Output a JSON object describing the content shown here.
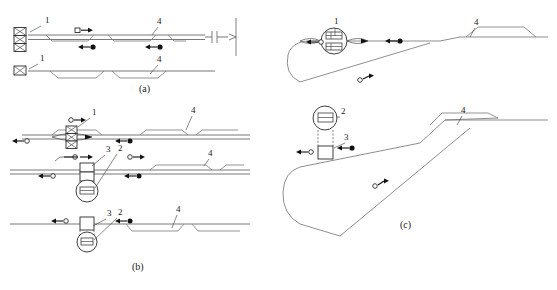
{
  "figure": {
    "title": "",
    "background": "#ffffff",
    "line_color": "#6a6a6a",
    "marker_solid_color": "#111111",
    "marker_open_color": "#ffffff",
    "width": 557,
    "height": 290
  },
  "panels": [
    {
      "id": "a",
      "caption": "(a)",
      "caption_x": 139,
      "caption_y": 92,
      "callouts": [
        {
          "text": "1",
          "x": 45,
          "y": 23
        },
        {
          "text": "4",
          "x": 157,
          "y": 24
        },
        {
          "text": "1",
          "x": 40,
          "y": 61
        },
        {
          "text": "4",
          "x": 157,
          "y": 62
        }
      ]
    },
    {
      "id": "b",
      "caption": "(b)",
      "caption_x": 132,
      "caption_y": 270,
      "callouts": [
        {
          "text": "1",
          "x": 92,
          "y": 115
        },
        {
          "text": "4",
          "x": 191,
          "y": 113
        },
        {
          "text": "3",
          "x": 106,
          "y": 152
        },
        {
          "text": "2",
          "x": 118,
          "y": 151
        },
        {
          "text": "4",
          "x": 208,
          "y": 156
        },
        {
          "text": "3",
          "x": 107,
          "y": 216
        },
        {
          "text": "2",
          "x": 118,
          "y": 215
        },
        {
          "text": "4",
          "x": 176,
          "y": 212
        }
      ]
    },
    {
      "id": "c",
      "caption": "(c)",
      "caption_x": 400,
      "caption_y": 228,
      "callouts": [
        {
          "text": "1",
          "x": 334,
          "y": 24
        },
        {
          "text": "4",
          "x": 474,
          "y": 25
        },
        {
          "text": "2",
          "x": 341,
          "y": 114
        },
        {
          "text": "3",
          "x": 344,
          "y": 140
        },
        {
          "text": "4",
          "x": 461,
          "y": 113
        }
      ]
    }
  ],
  "legend_semantics": {
    "item_1": "stacked crossed-box device",
    "item_2": "circular detector device",
    "item_3": "rectangular device",
    "item_4": "platform / siding segment"
  },
  "markers": {
    "open_label": "open marker, direction right",
    "solid_label": "solid marker, direction left"
  }
}
